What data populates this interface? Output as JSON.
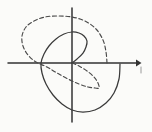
{
  "figure": {
    "background_color": "#fbfbf9",
    "width": 152,
    "height": 132,
    "origin": {
      "x": 72,
      "y": 63
    }
  },
  "axes": {
    "x_axis": {
      "label": "x-axis",
      "color": "#333333",
      "y": 63,
      "x_start": 8,
      "x_end": 140,
      "arrowhead": "right"
    },
    "y_axis": {
      "label": "y-axis",
      "color": "#333333",
      "x": 72,
      "y_start": 8,
      "y_end": 122,
      "arrowhead": "none"
    }
  },
  "chart_data": {
    "type": "line",
    "xlabel": "",
    "ylabel": "",
    "grid": false,
    "legend_position": "none",
    "coordinate_system": "polar",
    "origin_px": [
      72,
      63
    ],
    "xlim": [
      8,
      140
    ],
    "ylim": [
      8,
      122
    ],
    "series": [
      {
        "name": "solid-spiral",
        "style": "solid",
        "color": "#3a3a3a",
        "description": "Archimedean spiral starting at the origin, winding counter-clockwise outward through the upper-right, upper-left, lower-left and lower-right quadrants, terminating on the positive x-axis.",
        "turns": 1.75,
        "points_px": [
          [
            72,
            63
          ],
          [
            77,
            59
          ],
          [
            83,
            53
          ],
          [
            86,
            47
          ],
          [
            87,
            41
          ],
          [
            84,
            36
          ],
          [
            79,
            33
          ],
          [
            72,
            32
          ],
          [
            64,
            34
          ],
          [
            56,
            39
          ],
          [
            49,
            46
          ],
          [
            44,
            54
          ],
          [
            41,
            63
          ],
          [
            42,
            73
          ],
          [
            46,
            84
          ],
          [
            53,
            95
          ],
          [
            62,
            104
          ],
          [
            72,
            110
          ],
          [
            83,
            112
          ],
          [
            95,
            110
          ],
          [
            106,
            103
          ],
          [
            114,
            93
          ],
          [
            119,
            79
          ],
          [
            120,
            64
          ]
        ],
        "axis_crossings_px": [
          {
            "axis": "y",
            "value": 32,
            "note": "top of inner loop"
          },
          {
            "axis": "x",
            "value": 41,
            "note": "left crossing"
          },
          {
            "axis": "y",
            "value": 112,
            "note": "bottom of outer loop"
          },
          {
            "axis": "x",
            "value": 120,
            "note": "terminal point on positive x-axis"
          }
        ]
      },
      {
        "name": "dashed-spiral",
        "style": "dashed",
        "color": "#4a4a4a",
        "dash_pattern": "4 2.6",
        "description": "Archimedean spiral starting at the origin, winding counter-clockwise outward through the lower-right, lower-left, upper-left and upper-right quadrants, terminating on the positive x-axis.",
        "turns": 1.75,
        "points_px": [
          [
            72,
            63
          ],
          [
            79,
            66
          ],
          [
            87,
            71
          ],
          [
            94,
            77
          ],
          [
            98,
            83
          ],
          [
            99,
            88
          ],
          [
            95,
            88
          ],
          [
            88,
            87
          ],
          [
            79,
            84
          ],
          [
            68,
            79
          ],
          [
            57,
            73
          ],
          [
            47,
            67
          ],
          [
            36,
            62
          ],
          [
            28,
            55
          ],
          [
            23,
            46
          ],
          [
            22,
            36
          ],
          [
            26,
            27
          ],
          [
            34,
            21
          ],
          [
            45,
            17
          ],
          [
            58,
            16
          ],
          [
            72,
            17
          ],
          [
            85,
            21
          ],
          [
            96,
            29
          ],
          [
            103,
            40
          ],
          [
            106,
            52
          ],
          [
            107,
            63
          ]
        ],
        "axis_crossings_px": [
          {
            "axis": "y",
            "value": 88,
            "note": "bottom of inner dashed loop"
          },
          {
            "axis": "x",
            "value": 22,
            "note": "left crossing"
          },
          {
            "axis": "y",
            "value": 16,
            "note": "top of outer dashed loop"
          },
          {
            "axis": "x",
            "value": 107,
            "note": "terminal point on positive x-axis"
          }
        ]
      }
    ],
    "annotations": [
      {
        "name": "stray-tick",
        "text": "",
        "position_px": [
          141,
          70
        ],
        "description": "faint short vertical mark to the right of the x-axis arrowhead"
      }
    ]
  }
}
